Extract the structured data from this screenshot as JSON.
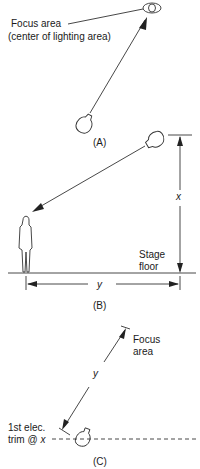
{
  "panel_a": {
    "focus_label_line1": "Focus area",
    "focus_label_line2": "(center of lighting area)",
    "caption": "(A)"
  },
  "panel_b": {
    "height_label": "x",
    "distance_label": "y",
    "floor_label_line1": "Stage",
    "floor_label_line2": "floor",
    "caption": "(B)"
  },
  "panel_c": {
    "focus_label_line1": "Focus area",
    "focus_label_line1_a": "Focus",
    "focus_label_line2": "area",
    "distance_label": "y",
    "trim_label_line1": "1st elec.",
    "trim_label_line2_prefix": "trim @ ",
    "trim_label_line2_var": "x",
    "caption": "(C)"
  }
}
